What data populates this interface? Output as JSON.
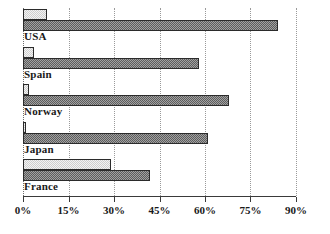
{
  "chart_data": {
    "type": "bar",
    "orientation": "horizontal",
    "title": "",
    "subtitle": "",
    "xlabel": "",
    "ylabel": "",
    "xlim": [
      0,
      90
    ],
    "xtick_labels": [
      "0%",
      "15%",
      "30%",
      "45%",
      "60%",
      "75%",
      "90%"
    ],
    "xticks": [
      0,
      15,
      30,
      45,
      60,
      75,
      90
    ],
    "grid": "vertical-dotted",
    "legend": "none",
    "categories": [
      "USA",
      "Spain",
      "Norway",
      "Japan",
      "France"
    ],
    "series": [
      {
        "name": "series-1-light",
        "color": "#cfcfcf",
        "values": [
          8,
          3.5,
          2,
          1,
          29
        ]
      },
      {
        "name": "series-2-dark",
        "color": "#5d5d5d",
        "values": [
          84,
          58,
          68,
          61,
          42
        ]
      }
    ],
    "groups": [
      {
        "label": "USA",
        "light": 8,
        "dark": 84
      },
      {
        "label": "Spain",
        "light": 3.5,
        "dark": 58
      },
      {
        "label": "Norway",
        "light": 2,
        "dark": 68
      },
      {
        "label": "Japan",
        "light": 1,
        "dark": 61
      },
      {
        "label": "France",
        "light": 29,
        "dark": 42
      }
    ]
  }
}
